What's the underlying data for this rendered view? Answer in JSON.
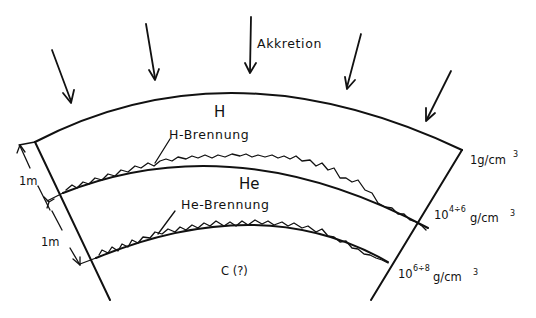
{
  "diagram": {
    "type": "accreting-star-shell-cross-section",
    "accretion_label": "Akkretion",
    "accretion_arrow_count": 5,
    "layers": [
      {
        "id": "H",
        "label": "H",
        "top_density": "1g/cm",
        "top_density_exp": "3"
      },
      {
        "id": "He",
        "label": "He",
        "top_density_base": "10",
        "top_density_sup": "4÷6",
        "top_density_unit": "g/cm",
        "top_density_exp": "3"
      },
      {
        "id": "C",
        "label": "C (?)",
        "top_density_base": "10",
        "top_density_sup": "6÷8",
        "top_density_unit": "g/cm",
        "top_density_exp": "3"
      }
    ],
    "burning_zones": [
      {
        "label": "H-Brennung"
      },
      {
        "label": "He-Brennung"
      }
    ],
    "thickness_markers": [
      {
        "label": "1m"
      },
      {
        "label": "1m"
      }
    ]
  }
}
